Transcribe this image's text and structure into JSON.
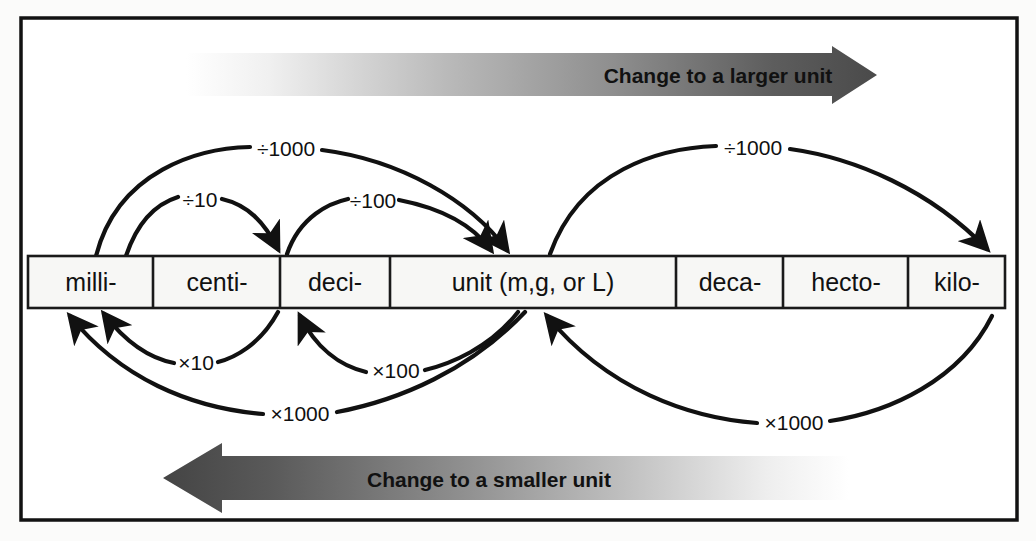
{
  "figure": {
    "frame_color": "#121212",
    "page_background": "#fbfbfa",
    "line_color": "#111111"
  },
  "banners": {
    "top": {
      "label": "Change to a larger unit",
      "direction": "right",
      "gradient_from": "#ffffff",
      "gradient_to": "#4a4a4a"
    },
    "bottom": {
      "label": "Change to a smaller unit",
      "direction": "left",
      "gradient_from": "#4a4a4a",
      "gradient_to": "#ffffff"
    }
  },
  "scale": {
    "cell_fill": "#f7f7f5",
    "cell_border": "#1a1a1a",
    "cells": [
      {
        "label": "milli-"
      },
      {
        "label": "centi-"
      },
      {
        "label": "deci-"
      },
      {
        "label": "unit (m,g, or L)"
      },
      {
        "label": "deca-"
      },
      {
        "label": "hecto-"
      },
      {
        "label": "kilo-"
      }
    ]
  },
  "arcs": {
    "above": [
      {
        "label": "÷1000",
        "from": "milli-",
        "to": "unit (m,g, or L)"
      },
      {
        "label": "÷10",
        "from": "milli-",
        "to": "deci-"
      },
      {
        "label": "÷100",
        "from": "deci-",
        "to": "unit (m,g, or L)"
      },
      {
        "label": "÷1000",
        "from": "unit (m,g, or L)",
        "to": "kilo-"
      }
    ],
    "below": [
      {
        "label": "×1000",
        "from": "unit (m,g, or L)",
        "to": "milli-"
      },
      {
        "label": "×10",
        "from": "deci-",
        "to": "milli-"
      },
      {
        "label": "×100",
        "from": "unit (m,g, or L)",
        "to": "deci-"
      },
      {
        "label": "×1000",
        "from": "kilo-",
        "to": "unit (m,g, or L)"
      }
    ]
  }
}
